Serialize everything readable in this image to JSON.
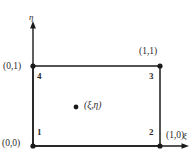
{
  "figure": {
    "type": "diagram",
    "stroke_color": "#1a1a1a",
    "background_color": "#ffffff"
  },
  "axes": {
    "vertical": {
      "label": "η",
      "direction": "up",
      "origin_px": [
        33,
        146
      ],
      "tip_px": [
        33,
        24
      ]
    },
    "horizontal": {
      "label": "ξ",
      "direction": "right",
      "origin_px": [
        33,
        146
      ],
      "tip_px": [
        189,
        146
      ]
    }
  },
  "element": {
    "shape": "rectangle",
    "bounds_px": {
      "left": 33,
      "top": 66,
      "right": 160,
      "bottom": 146
    }
  },
  "corner_coordinates": [
    {
      "key": "c00",
      "label": "(0,0)",
      "node": "1"
    },
    {
      "key": "c10",
      "label": "(1,0)",
      "node": "2"
    },
    {
      "key": "c11",
      "label": "(1,1)",
      "node": "3"
    },
    {
      "key": "c01",
      "label": "(0,1)",
      "node": "4"
    }
  ],
  "nodes": [
    {
      "id": "1",
      "label": "1",
      "position_px": [
        33,
        146
      ]
    },
    {
      "id": "2",
      "label": "2",
      "position_px": [
        160,
        146
      ]
    },
    {
      "id": "3",
      "label": "3",
      "position_px": [
        160,
        66
      ]
    },
    {
      "id": "4",
      "label": "4",
      "position_px": [
        33,
        66
      ]
    }
  ],
  "interior_point": {
    "label": "(ξ,η)",
    "marker": "filled-dot",
    "position_px": [
      76,
      107
    ]
  }
}
